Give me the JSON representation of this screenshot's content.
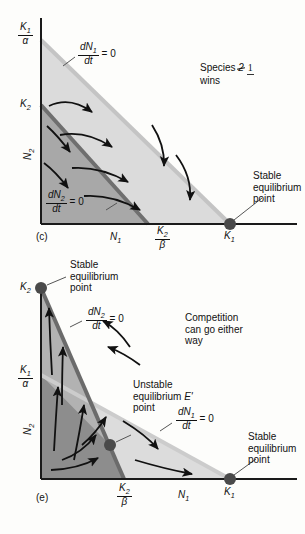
{
  "figure": {
    "colors": {
      "axis": "#1a1a1a",
      "light_region": "#dcdcdc",
      "mid_region": "#bdbdbd",
      "dark_region": "#9a9a9a",
      "darker_region": "#8a8a8a",
      "isocline_light": "#c9c9c9",
      "isocline_dark": "#6e6e6e",
      "point": "#4a4a4a",
      "arrow": "#111111",
      "leader": "#555555",
      "background": "#fdfdfb"
    }
  },
  "chart_data": {
    "type": "scatter",
    "xlabel": "N1",
    "ylabel": "N2",
    "panels": [
      {
        "id": "c",
        "panel_label": "(c)",
        "outcome_text_line1": "Species 2 1",
        "outcome_text_line2": "wins",
        "outcome_species_struck": "2",
        "outcome_species_handwritten": "1",
        "xaxis_label": "N1",
        "yaxis_label": "N2",
        "y_ticks": [
          "K1/α",
          "K2"
        ],
        "x_ticks": [
          "K2/β",
          "K1"
        ],
        "isoclines": [
          {
            "name": "dN1/dt = 0",
            "from": [
              0,
              "K1/α"
            ],
            "to": [
              "K1",
              0
            ]
          },
          {
            "name": "dN2/dt = 0",
            "from": [
              0,
              "K2"
            ],
            "to": [
              "K2/β",
              0
            ]
          }
        ],
        "equilibria": [
          {
            "label": "K1",
            "type": "stable",
            "annotation": "Stable equilibrium point",
            "at": [
              "K1",
              0
            ]
          }
        ],
        "note": "dN1/dt=0 isocline lies entirely above dN2/dt=0; all trajectories move right toward K1"
      },
      {
        "id": "e",
        "panel_label": "(e)",
        "outcome_text_line1": "Competition",
        "outcome_text_line2": "can go either",
        "outcome_text_line3": "way",
        "xaxis_label": "N1",
        "yaxis_label": "N2",
        "y_ticks": [
          "K2",
          "K1/α"
        ],
        "x_ticks": [
          "K2/β",
          "K1"
        ],
        "isoclines": [
          {
            "name": "dN2/dt = 0",
            "from": [
              0,
              "K2"
            ],
            "to": [
              "K2/β",
              0
            ]
          },
          {
            "name": "dN1/dt = 0",
            "from": [
              0,
              "K1/α"
            ],
            "to": [
              "K1",
              0
            ]
          }
        ],
        "equilibria": [
          {
            "label": "K2",
            "type": "stable",
            "annotation": "Stable equilibrium point",
            "at": [
              0,
              "K2"
            ]
          },
          {
            "label": "E'",
            "type": "unstable",
            "annotation": "Unstable equilibrium point",
            "at": [
              "interior",
              "interior"
            ]
          },
          {
            "label": "K1",
            "type": "stable",
            "annotation": "Stable equilibrium point",
            "at": [
              "K1",
              0
            ]
          }
        ],
        "note": "Isoclines cross at an unstable interior equilibrium E'; outcome depends on starting densities"
      }
    ]
  },
  "labels": {
    "dN1dt": {
      "num": "dN1",
      "den": "dt",
      "eq": "= 0"
    },
    "dN2dt": {
      "num": "dN2",
      "den": "dt",
      "eq": "= 0"
    },
    "K1_over_alpha": {
      "num": "K1",
      "den": "α"
    },
    "K2_over_beta": {
      "num": "K2",
      "den": "β"
    },
    "K1": "K1",
    "K2": "K2",
    "N1": "N1",
    "N2": "N2",
    "E_prime": "E'",
    "stable_1": "Stable",
    "stable_2": "equilibrium",
    "stable_3": "point",
    "unstable_1": "Unstable",
    "unstable_2": "equilibrium",
    "unstable_3": "point",
    "species_word": "Species",
    "species_num_struck": "2",
    "species_num_hand": "1",
    "wins": "wins",
    "competition_1": "Competition",
    "competition_2": "can go either",
    "competition_3": "way",
    "panel_c": "(c)",
    "panel_e": "(e)"
  }
}
